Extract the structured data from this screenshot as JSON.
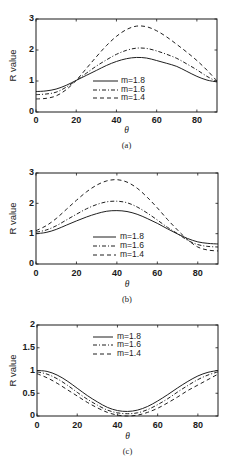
{
  "figure": {
    "line_color": "#1f1f1f",
    "background": "#ffffff"
  },
  "chart_data": [
    {
      "type": "line",
      "panel_label": "(a)",
      "xlabel": "θ",
      "ylabel": "R value",
      "xlim": [
        0,
        90
      ],
      "ylim": [
        0,
        3
      ],
      "xticks": [
        0,
        20,
        40,
        60,
        80
      ],
      "xtick_labels": [
        "0",
        "20",
        "40",
        "60",
        "80"
      ],
      "yticks": [
        0,
        1,
        2,
        3
      ],
      "ytick_labels": [
        "0",
        "1",
        "2",
        "3"
      ],
      "grid": false,
      "legend_location": "lower-center",
      "x": [
        0,
        5,
        10,
        15,
        20,
        25,
        30,
        35,
        40,
        45,
        50,
        55,
        60,
        65,
        70,
        75,
        80,
        85,
        90
      ],
      "series": [
        {
          "name": "m=1.8",
          "style": "solid",
          "values": [
            0.66,
            0.68,
            0.74,
            0.86,
            1.02,
            1.18,
            1.34,
            1.5,
            1.63,
            1.72,
            1.76,
            1.74,
            1.66,
            1.57,
            1.47,
            1.31,
            1.15,
            1.03,
            0.97
          ]
        },
        {
          "name": "m=1.6",
          "style": "dashdot",
          "values": [
            0.56,
            0.58,
            0.64,
            0.8,
            1.02,
            1.25,
            1.48,
            1.68,
            1.86,
            1.99,
            2.06,
            2.05,
            1.97,
            1.86,
            1.73,
            1.55,
            1.36,
            1.15,
            0.98
          ]
        },
        {
          "name": "m=1.4",
          "style": "dashed",
          "values": [
            0.42,
            0.44,
            0.52,
            0.72,
            1.02,
            1.4,
            1.78,
            2.14,
            2.44,
            2.66,
            2.77,
            2.75,
            2.62,
            2.42,
            2.18,
            1.93,
            1.66,
            1.35,
            1.0
          ]
        }
      ]
    },
    {
      "type": "line",
      "panel_label": "(b)",
      "xlabel": "θ",
      "ylabel": "R value",
      "xlim": [
        0,
        90
      ],
      "ylim": [
        0,
        3
      ],
      "xticks": [
        0,
        20,
        40,
        60,
        80
      ],
      "xtick_labels": [
        "0",
        "20",
        "40",
        "60",
        "80"
      ],
      "yticks": [
        0,
        1,
        2,
        3
      ],
      "ytick_labels": [
        "0",
        "1",
        "2",
        "3"
      ],
      "grid": false,
      "legend_location": "lower-center",
      "x": [
        0,
        5,
        10,
        15,
        20,
        25,
        30,
        35,
        40,
        45,
        50,
        55,
        60,
        65,
        70,
        75,
        80,
        85,
        90
      ],
      "series": [
        {
          "name": "m=1.8",
          "style": "solid",
          "values": [
            1.0,
            1.04,
            1.14,
            1.28,
            1.42,
            1.55,
            1.66,
            1.74,
            1.76,
            1.73,
            1.64,
            1.5,
            1.34,
            1.16,
            0.99,
            0.84,
            0.73,
            0.68,
            0.66
          ]
        },
        {
          "name": "m=1.6",
          "style": "dashdot",
          "values": [
            1.05,
            1.12,
            1.26,
            1.45,
            1.64,
            1.82,
            1.96,
            2.05,
            2.07,
            2.02,
            1.88,
            1.68,
            1.45,
            1.21,
            1.0,
            0.78,
            0.64,
            0.58,
            0.56
          ]
        },
        {
          "name": "m=1.4",
          "style": "dashed",
          "values": [
            1.1,
            1.26,
            1.5,
            1.8,
            2.1,
            2.38,
            2.6,
            2.74,
            2.78,
            2.7,
            2.5,
            2.2,
            1.85,
            1.47,
            1.12,
            0.8,
            0.56,
            0.46,
            0.43
          ]
        }
      ]
    },
    {
      "type": "line",
      "panel_label": "(c)",
      "xlabel": "θ",
      "ylabel": "R value",
      "xlim": [
        0,
        90
      ],
      "ylim": [
        0,
        2
      ],
      "xticks": [
        0,
        20,
        40,
        60,
        80
      ],
      "xtick_labels": [
        "0",
        "20",
        "40",
        "60",
        "80"
      ],
      "yticks": [
        0,
        0.5,
        1,
        1.5,
        2
      ],
      "ytick_labels": [
        "0",
        "0.5",
        "1",
        "1.5",
        "2"
      ],
      "grid": false,
      "legend_location": "upper-center",
      "x": [
        0,
        5,
        10,
        15,
        20,
        25,
        30,
        35,
        40,
        45,
        50,
        55,
        60,
        65,
        70,
        75,
        80,
        85,
        90
      ],
      "series": [
        {
          "name": "m=1.8",
          "style": "solid",
          "values": [
            1.0,
            0.98,
            0.9,
            0.77,
            0.61,
            0.45,
            0.31,
            0.19,
            0.12,
            0.1,
            0.13,
            0.21,
            0.33,
            0.47,
            0.62,
            0.76,
            0.88,
            0.96,
            1.0
          ]
        },
        {
          "name": "m=1.6",
          "style": "dashdot",
          "values": [
            0.97,
            0.92,
            0.82,
            0.68,
            0.52,
            0.37,
            0.24,
            0.13,
            0.07,
            0.05,
            0.07,
            0.14,
            0.25,
            0.38,
            0.53,
            0.67,
            0.8,
            0.9,
            0.97
          ]
        },
        {
          "name": "m=1.4",
          "style": "dashed",
          "values": [
            0.93,
            0.84,
            0.72,
            0.58,
            0.44,
            0.3,
            0.18,
            0.08,
            0.02,
            0.0,
            0.02,
            0.08,
            0.17,
            0.29,
            0.42,
            0.56,
            0.68,
            0.8,
            0.92
          ]
        }
      ]
    }
  ]
}
